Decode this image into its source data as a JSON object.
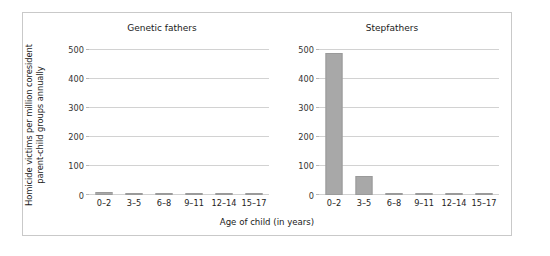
{
  "chart_data": {
    "type": "bar",
    "title": "",
    "xlabel": "Age of child (in years)",
    "ylabel_line1": "Homicide victims per million coresident",
    "ylabel_line2": "parent-child groups annually",
    "categories": [
      "0–2",
      "3–5",
      "6–8",
      "9–11",
      "12–14",
      "15–17"
    ],
    "ylim": [
      0,
      500
    ],
    "yticks": [
      0,
      100,
      200,
      300,
      400,
      500
    ],
    "ytick_labels": [
      "0",
      "100",
      "200",
      "300",
      "400",
      "500"
    ],
    "grid": true,
    "legend": "none",
    "panels": [
      {
        "title": "Genetic fathers",
        "values": [
          11,
          6,
          4,
          3,
          2,
          2
        ]
      },
      {
        "title": "Stepfathers",
        "values": [
          490,
          65,
          8,
          8,
          5,
          5
        ]
      }
    ],
    "bar_color": "#a8a8a8",
    "grid_color": "#d2d2d2",
    "frame_color": "#c9c9c9"
  }
}
